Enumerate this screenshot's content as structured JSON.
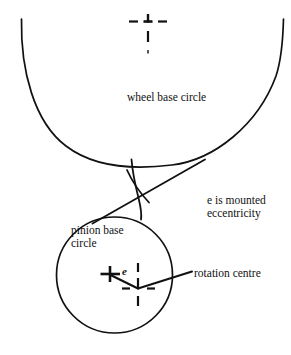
{
  "diagram": {
    "stroke_color": "#111111",
    "background_color": "#ffffff",
    "labels": {
      "wheel_base_circle": "wheel base circle",
      "pinion_base_circle_line1": "pinion base",
      "pinion_base_circle_line2": "circle",
      "eccentricity_line1": "e is mounted",
      "eccentricity_line2": "eccentricity",
      "rotation_centre": "rotation centre",
      "e_symbol": "e"
    },
    "geometry": {
      "wheel_base_circle": {
        "center_x": 152,
        "center_y": -58,
        "radius": 221,
        "note": "large arc, only lower portion visible"
      },
      "pinion_base_circle": {
        "center_x": 114.5,
        "center_y": 275,
        "radius": 58
      },
      "wheel_centre_marker": {
        "x": 148,
        "y": 22,
        "style": "dash-dot-crosshair"
      },
      "rotation_centre_marker": {
        "x": 138,
        "y": 288,
        "style": "dash-dot-crosshair"
      },
      "pinion_centre_marker": {
        "x": 110,
        "y": 274,
        "style": "plus-cross"
      },
      "line_of_action": {
        "x1": 204,
        "y1": 160,
        "x2": 93,
        "y2": 223
      },
      "eccentricity_vector": {
        "x1": 110,
        "y1": 274,
        "x2": 138,
        "y2": 288
      },
      "rotation_centre_leader": {
        "x1": 138,
        "y1": 288,
        "x2": 192,
        "y2": 272
      }
    }
  }
}
